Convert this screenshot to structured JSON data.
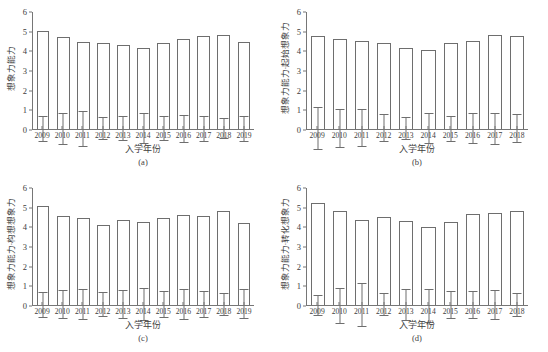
{
  "figure": {
    "width": 548,
    "height": 352,
    "background": "#ffffff",
    "line_color": "#6e6e6e",
    "text_color": "#3d3d3d"
  },
  "chart_data": [
    {
      "type": "bar",
      "panel": "(a)",
      "title": "",
      "xlabel": "入学年份",
      "ylabel": "想象力能力",
      "ylim": [
        0,
        6
      ],
      "yticks": [
        0,
        1,
        2,
        3,
        4,
        5,
        6
      ],
      "grid": false,
      "legend": "none",
      "categories": [
        "2009",
        "2010",
        "2011",
        "2012",
        "2013",
        "2014",
        "2015",
        "2016",
        "2017",
        "2018",
        "2019"
      ],
      "values": [
        5.0,
        4.68,
        4.42,
        4.35,
        4.25,
        4.1,
        4.35,
        4.6,
        4.72,
        4.8,
        4.42
      ],
      "err_low": [
        4.35,
        3.88,
        3.5,
        3.78,
        3.65,
        3.33,
        3.75,
        3.9,
        4.08,
        4.28,
        3.78
      ],
      "err_high": [
        5.62,
        5.45,
        5.3,
        4.92,
        4.88,
        4.88,
        4.95,
        5.28,
        5.35,
        5.3,
        5.05
      ]
    },
    {
      "type": "bar",
      "panel": "(b)",
      "title": "",
      "xlabel": "入学年份",
      "ylabel": "想象力能力·起始想象力",
      "ylim": [
        0,
        6
      ],
      "yticks": [
        0,
        1,
        2,
        3,
        4,
        5,
        6
      ],
      "grid": false,
      "legend": "none",
      "categories": [
        "2009",
        "2010",
        "2011",
        "2012",
        "2013",
        "2014",
        "2015",
        "2016",
        "2017",
        "2018"
      ],
      "values": [
        4.75,
        4.6,
        4.45,
        4.35,
        4.1,
        4.0,
        4.35,
        4.5,
        4.8,
        4.75
      ],
      "err_low": [
        3.68,
        3.62,
        3.52,
        3.68,
        3.55,
        3.22,
        3.68,
        3.72,
        4.0,
        4.05
      ],
      "err_high": [
        5.8,
        5.55,
        5.4,
        5.05,
        4.68,
        4.78,
        4.95,
        5.28,
        5.58,
        5.45
      ]
    },
    {
      "type": "bar",
      "panel": "(c)",
      "title": "",
      "xlabel": "入学年份",
      "ylabel": "想象力能力·构想想象力",
      "ylim": [
        0,
        6
      ],
      "yticks": [
        0,
        1,
        2,
        3,
        4,
        5,
        6
      ],
      "grid": false,
      "legend": "none",
      "categories": [
        "2009",
        "2010",
        "2011",
        "2012",
        "2013",
        "2014",
        "2015",
        "2016",
        "2017",
        "2018",
        "2019"
      ],
      "values": [
        5.05,
        4.55,
        4.4,
        4.05,
        4.3,
        4.2,
        4.4,
        4.6,
        4.52,
        4.78,
        4.15
      ],
      "err_low": [
        4.4,
        3.82,
        3.65,
        3.45,
        3.6,
        3.38,
        3.75,
        3.85,
        3.85,
        4.2,
        3.45
      ],
      "err_high": [
        5.68,
        5.25,
        5.15,
        4.68,
        5.0,
        5.0,
        5.08,
        5.38,
        5.2,
        5.32,
        4.92
      ]
    },
    {
      "type": "bar",
      "panel": "(d)",
      "title": "",
      "xlabel": "入学年份",
      "ylabel": "想象力能力·转化想象力",
      "ylim": [
        0,
        6
      ],
      "yticks": [
        0,
        1,
        2,
        3,
        4,
        5,
        6
      ],
      "grid": false,
      "legend": "none",
      "categories": [
        "2009",
        "2010",
        "2011",
        "2012",
        "2013",
        "2014",
        "2015",
        "2016",
        "2017",
        "2018"
      ],
      "values": [
        5.18,
        4.8,
        4.3,
        4.45,
        4.25,
        3.98,
        4.2,
        4.65,
        4.7,
        4.8
      ],
      "err_low": [
        4.6,
        3.85,
        3.2,
        3.88,
        3.42,
        3.08,
        3.48,
        3.95,
        3.95,
        4.2
      ],
      "err_high": [
        5.65,
        5.6,
        5.35,
        5.02,
        5.0,
        4.72,
        4.85,
        5.32,
        5.42,
        5.38
      ]
    }
  ]
}
